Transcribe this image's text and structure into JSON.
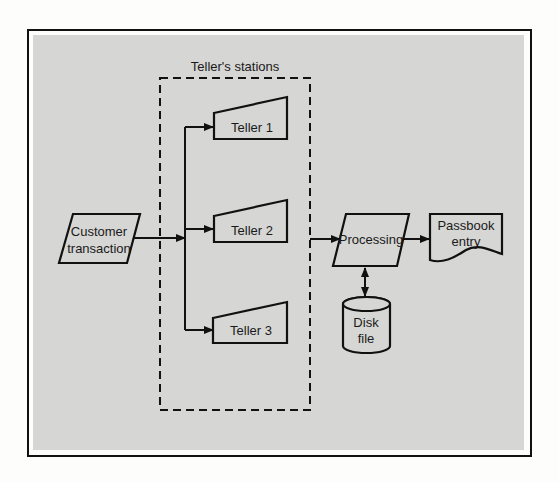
{
  "diagram": {
    "title": "Teller's stations",
    "colors": {
      "panel": "#d6d6d4",
      "page": "#fdfdfc",
      "stroke": "#111111"
    },
    "nodes": {
      "customer": {
        "line1": "Customer",
        "line2": "transaction",
        "shape": "parallelogram-input"
      },
      "teller1": {
        "label": "Teller 1",
        "shape": "manual-input"
      },
      "teller2": {
        "label": "Teller 2",
        "shape": "manual-input"
      },
      "teller3": {
        "label": "Teller 3",
        "shape": "manual-input"
      },
      "processing": {
        "label": "Processing",
        "shape": "parallelogram-process"
      },
      "passbook": {
        "line1": "Passbook",
        "line2": "entry",
        "shape": "document"
      },
      "disk": {
        "line1": "Disk",
        "line2": "file",
        "shape": "cylinder"
      }
    },
    "edges": [
      {
        "from": "customer",
        "to": "teller1"
      },
      {
        "from": "customer",
        "to": "teller2"
      },
      {
        "from": "customer",
        "to": "teller3"
      },
      {
        "from": "tellers-group",
        "to": "processing"
      },
      {
        "from": "processing",
        "to": "passbook"
      },
      {
        "from": "processing",
        "to": "disk",
        "bidirectional": true
      }
    ]
  }
}
